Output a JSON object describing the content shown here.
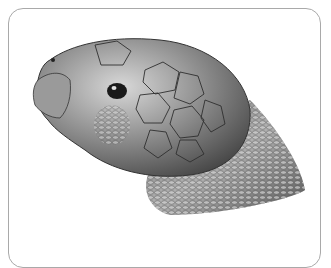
{
  "image": {
    "subject": "Tortoise head illustration",
    "style": "grayscale pencil drawing",
    "frame": {
      "border_color": "#a9a9a9",
      "background": "#ffffff",
      "corner_radius": 15
    }
  }
}
